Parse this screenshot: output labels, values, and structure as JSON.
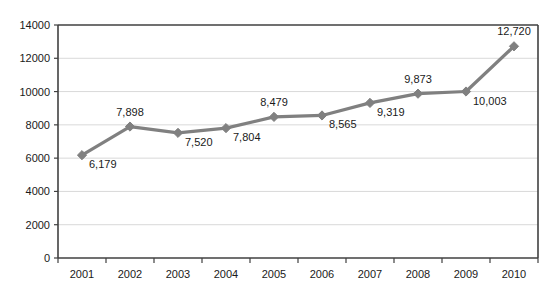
{
  "chart_data": {
    "type": "line",
    "title": "",
    "subtitle": "",
    "xlabel": "",
    "ylabel": "",
    "categories": [
      "2001",
      "2002",
      "2003",
      "2004",
      "2005",
      "2006",
      "2007",
      "2008",
      "2009",
      "2010"
    ],
    "values": [
      6179,
      7898,
      7520,
      7804,
      8479,
      8565,
      9319,
      9873,
      10003,
      12720
    ],
    "point_labels": [
      "6,179",
      "7,898",
      "7,520",
      "7,804",
      "8,479",
      "8,565",
      "9,319",
      "9,873",
      "10,003",
      "12,720"
    ],
    "label_positions": [
      "below-right",
      "above",
      "below-right",
      "below-right",
      "above",
      "below-right",
      "below-right",
      "above",
      "below-right",
      "above"
    ],
    "ylim": [
      0,
      14000
    ],
    "ytick_values": [
      0,
      2000,
      4000,
      6000,
      8000,
      10000,
      12000,
      14000
    ],
    "ytick_labels": [
      "0",
      "2000",
      "4000",
      "6000",
      "8000",
      "10000",
      "12000",
      "14000"
    ],
    "grid": "horizontal",
    "legend": "none",
    "series_color": "#808080",
    "marker": "diamond",
    "axis_color": "#404040",
    "gridline_color": "#d9d9d9",
    "background_color": "#ffffff",
    "text_color": "#1a1a1a"
  }
}
